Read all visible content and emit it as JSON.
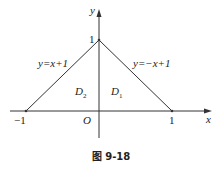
{
  "figure": {
    "caption": "图 9-18",
    "axes": {
      "x_label": "x",
      "y_label": "y",
      "origin_label": "O"
    },
    "ticks": {
      "x_neg": "−1",
      "x_pos": "1",
      "y_pos": "1"
    },
    "lines": [
      {
        "label": "y=x+1",
        "from": [
          -1,
          0
        ],
        "to": [
          0,
          1
        ]
      },
      {
        "label": "y=−x+1",
        "from": [
          0,
          1
        ],
        "to": [
          1,
          0
        ]
      }
    ],
    "regions": [
      {
        "label": "D",
        "sub": "2",
        "side": "left"
      },
      {
        "label": "D",
        "sub": "1",
        "side": "right"
      }
    ],
    "colors": {
      "stroke": "#333333",
      "background": "#ffffff"
    }
  }
}
